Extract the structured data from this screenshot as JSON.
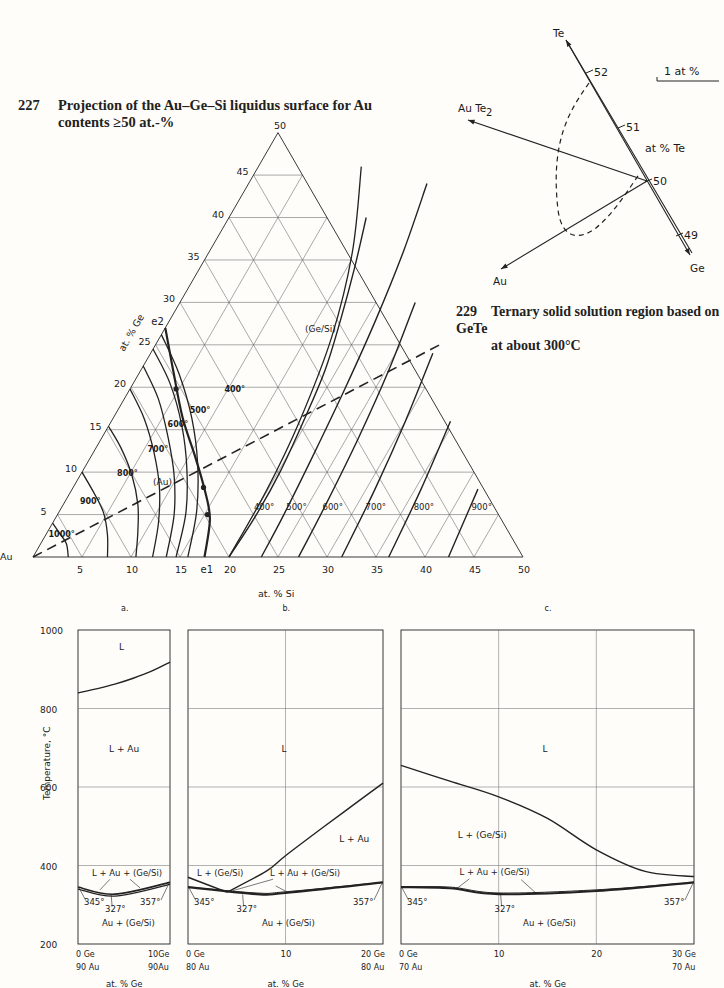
{
  "captions": {
    "fig227": {
      "number": "227",
      "line1": "Projection of the Au–Ge–Si liquidus surface for Au",
      "line2": "contents ≥50 at.-%"
    },
    "fig229": {
      "number": "229",
      "line1": "Ternary solid solution region based on GeTe",
      "line2": "at about 300°C"
    }
  },
  "chart_data": [
    {
      "id": "fig227",
      "type": "ternary-liquidus-projection",
      "title": "Projection of the Au–Ge–Si liquidus surface for Au contents ≥50 at.-%",
      "corner_label": "Au",
      "xlabel": "at. % Si",
      "ylabel": "at. % Ge",
      "x_ticks": [
        "5",
        "10",
        "15",
        "20",
        "25",
        "30",
        "35",
        "40",
        "45",
        "50"
      ],
      "y_ticks": [
        "5",
        "10",
        "15",
        "20",
        "25",
        "30",
        "35",
        "40",
        "45",
        "50"
      ],
      "range": {
        "si": [
          0,
          50
        ],
        "ge": [
          0,
          50
        ]
      },
      "grid": true,
      "eutectic_labels": [
        "e1",
        "e2"
      ],
      "region_labels": [
        "(Au)",
        "(Ge/Si)"
      ],
      "au_side_isotherms": [
        "1000°",
        "900°",
        "800°",
        "700°",
        "600°",
        "500°",
        "400°"
      ],
      "si_side_isotherms": [
        "400°",
        "500°",
        "600°",
        "700°",
        "800°",
        "900°"
      ],
      "e1_si": 17.5,
      "e2_ge": 27,
      "section_line": {
        "from_si": 0,
        "from_ge": 0,
        "to_si": 29,
        "to_ge": 25,
        "style": "dashed"
      }
    },
    {
      "id": "fig229",
      "type": "vector-diagram",
      "title": "Ternary solid solution region based on GeTe at about 300°C",
      "axes": [
        "Te",
        "Ge",
        "AuTe2",
        "Au"
      ],
      "axis_label": "at % Te",
      "ticks": [
        "52",
        "51",
        "50",
        "49"
      ],
      "scale_label": "1 at %"
    },
    {
      "id": "sections",
      "type": "line",
      "ylabel": "Temperature, °C",
      "ylim": [
        200,
        1000
      ],
      "y_ticks": [
        "1000",
        "800",
        "600",
        "400",
        "200"
      ],
      "xlabel": "at. % Ge",
      "grid": true,
      "panels": [
        {
          "label": "a.",
          "x_range": [
            0,
            10
          ],
          "x_left": [
            "0 Ge",
            "90 Au"
          ],
          "x_right": [
            "10Ge",
            "90Au"
          ],
          "x_ticks": [],
          "liquidus": {
            "x": [
              0,
              2,
              4,
              6,
              8,
              10
            ],
            "y": [
              840,
              850,
              862,
              877,
              895,
              918
            ]
          },
          "solidus_upper": {
            "x": [
              0,
              4,
              10
            ],
            "y": [
              345,
              327,
              357
            ]
          },
          "solidus_lower": {
            "x": [
              0,
              4,
              10
            ],
            "y": [
              345,
              327,
              357
            ]
          },
          "regions": [
            "L",
            "L + Au",
            "L + Au + (Ge/Si)",
            "Au + (Ge/Si)"
          ],
          "points": [
            "345°",
            "327°",
            "357°"
          ]
        },
        {
          "label": "b.",
          "x_range": [
            0,
            20
          ],
          "x_left": [
            "0 Ge",
            "80 Au"
          ],
          "x_right": [
            "20 Ge",
            "80 Au"
          ],
          "x_ticks": [
            "10"
          ],
          "liquidus_geSi": {
            "x": [
              0,
              4
            ],
            "y": [
              370,
              332
            ]
          },
          "liquidus": {
            "x": [
              4,
              8,
              10,
              14,
              17,
              20
            ],
            "y": [
              332,
              385,
              425,
              500,
              555,
              610
            ]
          },
          "solidus": {
            "x": [
              0,
              7,
              10,
              20
            ],
            "y": [
              345,
              327,
              330,
              357
            ]
          },
          "regions": [
            "L",
            "L + Au",
            "L + (Ge/Si)",
            "L + Au + (Ge/Si)",
            "Au + (Ge/Si)"
          ],
          "points": [
            "345°",
            "327°",
            "357°"
          ]
        },
        {
          "label": "c.",
          "x_range": [
            0,
            30
          ],
          "x_left": [
            "0 Ge",
            "70 Au"
          ],
          "x_right": [
            "30 Ge",
            "70 Au"
          ],
          "x_ticks": [
            "10",
            "20"
          ],
          "liquidus": {
            "x": [
              0,
              5,
              10,
              15,
              20,
              25,
              30
            ],
            "y": [
              655,
              615,
              575,
              520,
              440,
              385,
              372
            ]
          },
          "solidus": {
            "x": [
              0,
              5,
              10,
              20,
              30
            ],
            "y": [
              345,
              342,
              327,
              335,
              357
            ]
          },
          "regions": [
            "L",
            "L + (Ge/Si)",
            "L + Au + (Ge/Si)",
            "Au + (Ge/Si)"
          ],
          "points": [
            "345°",
            "327°",
            "357°"
          ]
        }
      ]
    }
  ]
}
